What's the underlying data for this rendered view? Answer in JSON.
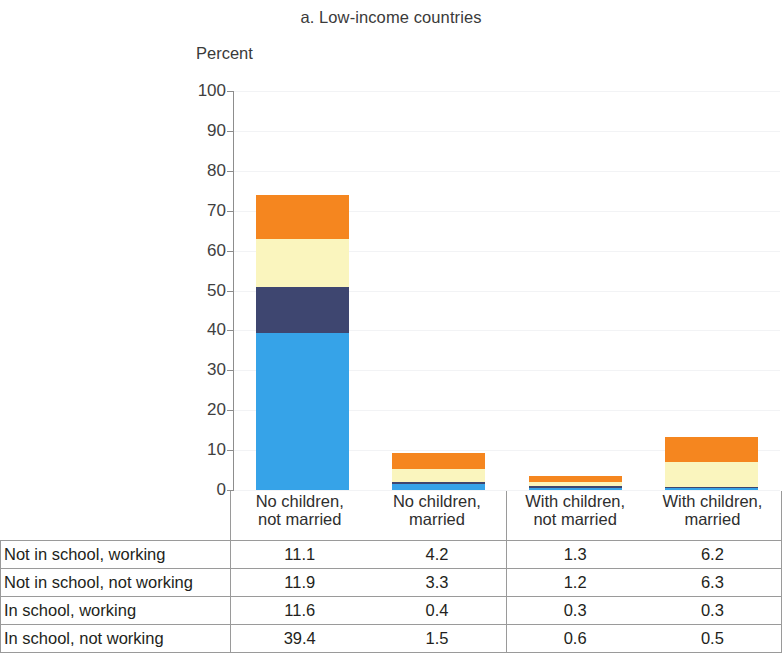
{
  "chart_title": "a. Low-income countries",
  "y_axis_title": "Percent",
  "chart_data": {
    "type": "bar",
    "title": "a. Low-income countries",
    "subtitle": "",
    "xlabel": "",
    "ylabel": "Percent",
    "ylim": [
      0,
      100
    ],
    "yticks": [
      0,
      10,
      20,
      30,
      40,
      50,
      60,
      70,
      80,
      90,
      100
    ],
    "ytick_labels": [
      "0",
      "10",
      "20",
      "30",
      "40",
      "50",
      "60",
      "70",
      "80",
      "90",
      "100"
    ],
    "grid": true,
    "stacked": true,
    "legend_position": "none",
    "categories": [
      "No children, not married",
      "No children, married",
      "With children, not married",
      "With children, married"
    ],
    "category_lines": [
      [
        "No children,",
        "not married"
      ],
      [
        "No children,",
        "married"
      ],
      [
        "With children,",
        "not married"
      ],
      [
        "With children,",
        "married"
      ]
    ],
    "series": [
      {
        "name": "In school, not working",
        "color": "#36a3e8",
        "values": [
          39.4,
          1.5,
          0.6,
          0.5
        ]
      },
      {
        "name": "In school, working",
        "color": "#3e4670",
        "values": [
          11.6,
          0.4,
          0.3,
          0.3
        ]
      },
      {
        "name": "Not in school, not working",
        "color": "#faf5be",
        "values": [
          11.9,
          3.3,
          1.2,
          6.3
        ]
      },
      {
        "name": "Not in school, working",
        "color": "#f5861f",
        "values": [
          11.1,
          4.2,
          1.3,
          6.2
        ]
      }
    ],
    "stack_order_bottom_to_top": [
      "In school, not working",
      "In school, working",
      "Not in school, not working",
      "Not in school, working"
    ],
    "totals": [
      74.0,
      9.4,
      3.4,
      13.3
    ]
  },
  "table": {
    "header_row": [
      "",
      [
        "No children,",
        "not married"
      ],
      [
        "No children,",
        "married"
      ],
      [
        "With children,",
        "not married"
      ],
      [
        "With children,",
        "married"
      ]
    ],
    "rows": [
      {
        "label": "Not in school, working",
        "values": [
          "11.1",
          "4.2",
          "1.3",
          "6.2"
        ]
      },
      {
        "label": "Not in school, not working",
        "values": [
          "11.9",
          "3.3",
          "1.2",
          "6.3"
        ]
      },
      {
        "label": "In school, working",
        "values": [
          "11.6",
          "0.4",
          "0.3",
          "0.3"
        ]
      },
      {
        "label": "In school, not working",
        "values": [
          "39.4",
          "1.5",
          "0.6",
          "0.5"
        ]
      }
    ]
  },
  "colors": {
    "in_school_not_working": "#36a3e8",
    "in_school_working": "#3e4670",
    "not_in_school_not_working": "#faf5be",
    "not_in_school_working": "#f5861f",
    "axis": "#6f6f6f",
    "gridline": "#f2f3f5",
    "table_border": "#9a9a9a"
  }
}
